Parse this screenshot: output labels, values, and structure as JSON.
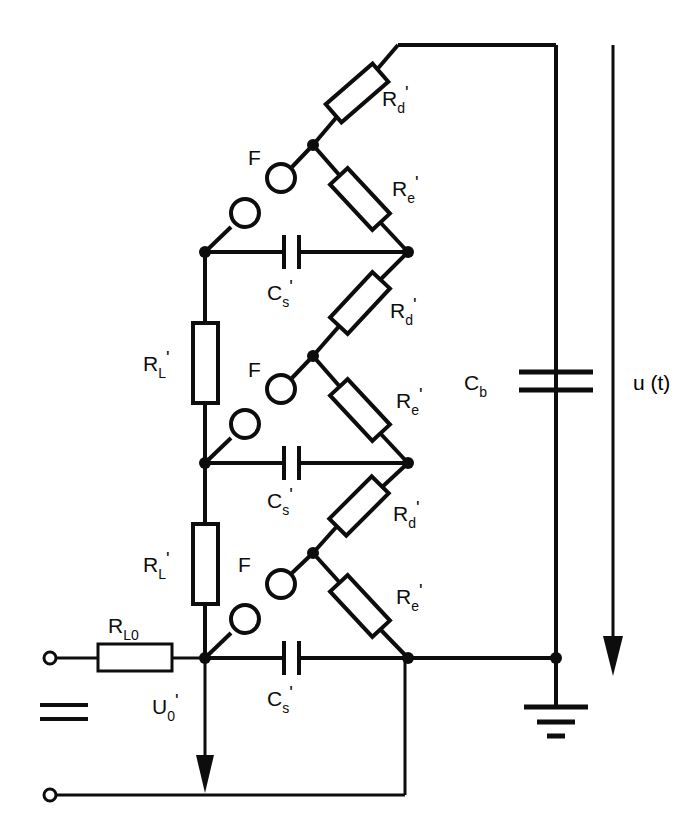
{
  "diagram": {
    "type": "electrical-schematic",
    "stage_count": 3,
    "line_color": "#0d0d0d",
    "background_color": "#ffffff"
  },
  "labels": {
    "r_d": "R",
    "r_d_sub": "d",
    "r_d_prime": "'",
    "r_e": "R",
    "r_e_sub": "e",
    "r_e_prime": "'",
    "r_l": "R",
    "r_l_sub": "L",
    "r_l_prime": "'",
    "r_l0": "R",
    "r_l0_sub": "L0",
    "c_s": "C",
    "c_s_sub": "s",
    "c_s_prime": "'",
    "c_b": "C",
    "c_b_sub": "b",
    "f": "F",
    "u0": "U",
    "u0_sub": "0",
    "u0_prime": "'",
    "ut": "u (t)"
  },
  "components": {
    "spark_gaps": [
      {
        "name": "F",
        "stage": 1
      },
      {
        "name": "F",
        "stage": 2
      },
      {
        "name": "F",
        "stage": 3
      }
    ],
    "damping_resistors": [
      {
        "name": "Rd'",
        "stage": 1
      },
      {
        "name": "Rd'",
        "stage": 2
      },
      {
        "name": "Rd'",
        "stage": 3
      }
    ],
    "charging_resistors_e": [
      {
        "name": "Re'",
        "stage": 1
      },
      {
        "name": "Re'",
        "stage": 2
      },
      {
        "name": "Re'",
        "stage": 3
      }
    ],
    "charging_resistors_l": [
      {
        "name": "RL'",
        "stage": 1
      },
      {
        "name": "RL'",
        "stage": 2
      }
    ],
    "stage_capacitors": [
      {
        "name": "Cs'",
        "stage": 1
      },
      {
        "name": "Cs'",
        "stage": 2
      },
      {
        "name": "Cs'",
        "stage": 3
      }
    ],
    "load_capacitor": {
      "name": "Cb"
    },
    "series_resistor": {
      "name": "RL0"
    },
    "source_voltage": {
      "name": "U0'",
      "direction": "down"
    },
    "output_voltage": {
      "name": "u(t)",
      "direction": "down"
    },
    "ground": {
      "name": "earth",
      "bars": 3
    },
    "terminals": [
      {
        "name": "input-terminal-positive"
      },
      {
        "name": "input-terminal-negative"
      }
    ],
    "dc_symbol": {
      "name": "dc-source-symbol",
      "bars": 2
    }
  }
}
